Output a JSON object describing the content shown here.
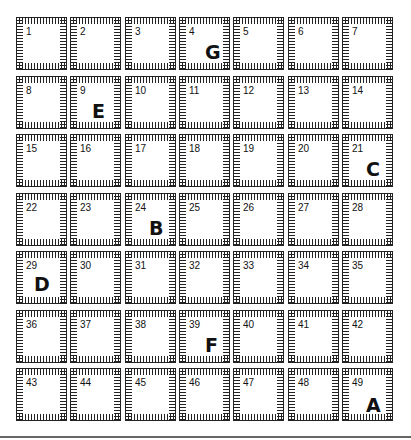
{
  "grid": {
    "rows": 7,
    "cols": 7,
    "origin": [
      16,
      17
    ],
    "col_pitch": 54.3,
    "row_pitch": 58.5,
    "cells": [
      {
        "n": "1",
        "letter": ""
      },
      {
        "n": "2",
        "letter": ""
      },
      {
        "n": "3",
        "letter": ""
      },
      {
        "n": "4",
        "letter": "G"
      },
      {
        "n": "5",
        "letter": ""
      },
      {
        "n": "6",
        "letter": ""
      },
      {
        "n": "7",
        "letter": ""
      },
      {
        "n": "8",
        "letter": ""
      },
      {
        "n": "9",
        "letter": "E"
      },
      {
        "n": "10",
        "letter": ""
      },
      {
        "n": "11",
        "letter": ""
      },
      {
        "n": "12",
        "letter": ""
      },
      {
        "n": "13",
        "letter": ""
      },
      {
        "n": "14",
        "letter": ""
      },
      {
        "n": "15",
        "letter": ""
      },
      {
        "n": "16",
        "letter": ""
      },
      {
        "n": "17",
        "letter": ""
      },
      {
        "n": "18",
        "letter": ""
      },
      {
        "n": "19",
        "letter": ""
      },
      {
        "n": "20",
        "letter": ""
      },
      {
        "n": "21",
        "letter": "C"
      },
      {
        "n": "22",
        "letter": ""
      },
      {
        "n": "23",
        "letter": ""
      },
      {
        "n": "24",
        "letter": "B"
      },
      {
        "n": "25",
        "letter": ""
      },
      {
        "n": "26",
        "letter": ""
      },
      {
        "n": "27",
        "letter": ""
      },
      {
        "n": "28",
        "letter": ""
      },
      {
        "n": "29",
        "letter": "D"
      },
      {
        "n": "30",
        "letter": ""
      },
      {
        "n": "31",
        "letter": ""
      },
      {
        "n": "32",
        "letter": ""
      },
      {
        "n": "33",
        "letter": ""
      },
      {
        "n": "34",
        "letter": ""
      },
      {
        "n": "35",
        "letter": ""
      },
      {
        "n": "36",
        "letter": ""
      },
      {
        "n": "37",
        "letter": ""
      },
      {
        "n": "38",
        "letter": ""
      },
      {
        "n": "39",
        "letter": "F"
      },
      {
        "n": "40",
        "letter": ""
      },
      {
        "n": "41",
        "letter": ""
      },
      {
        "n": "42",
        "letter": ""
      },
      {
        "n": "43",
        "letter": ""
      },
      {
        "n": "44",
        "letter": ""
      },
      {
        "n": "45",
        "letter": ""
      },
      {
        "n": "46",
        "letter": ""
      },
      {
        "n": "47",
        "letter": ""
      },
      {
        "n": "48",
        "letter": ""
      },
      {
        "n": "49",
        "letter": "A"
      }
    ],
    "letter_offsets": {
      "G": [
        26,
        24
      ],
      "E": [
        22,
        24
      ],
      "C": [
        24,
        24
      ],
      "B": [
        24,
        24
      ],
      "D": [
        18,
        22
      ],
      "F": [
        26,
        24
      ],
      "A": [
        24,
        26
      ]
    }
  },
  "colors": {
    "line": "#222222",
    "text": "#111111",
    "rule": "#666666",
    "background": "#ffffff"
  }
}
